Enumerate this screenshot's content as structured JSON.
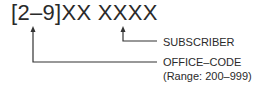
{
  "diagram": {
    "pattern": "[2–9]XX XXXX",
    "labels": {
      "subscriber": "SUBSCRIBER",
      "office_code": "OFFICE–CODE",
      "office_code_range": "(Range: 200–999)"
    },
    "line_color": "#333333"
  }
}
